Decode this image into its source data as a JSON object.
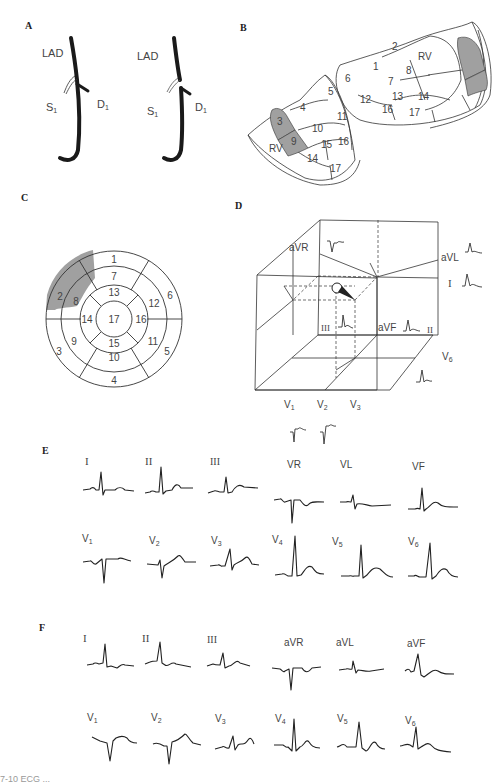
{
  "panels": {
    "A": {
      "label": "A",
      "left": {
        "lad": "LAD",
        "s1": "S",
        "s1_sub": "1",
        "d1": "D",
        "d1_sub": "1"
      },
      "right": {
        "lad": "LAD",
        "s1": "S",
        "s1_sub": "1",
        "d1": "D",
        "d1_sub": "1"
      }
    },
    "B": {
      "label": "B",
      "upper_segments": [
        "1",
        "2",
        "6",
        "7",
        "8",
        "12",
        "13",
        "14",
        "16",
        "17"
      ],
      "lower_segments": [
        "3",
        "4",
        "5",
        "9",
        "10",
        "11",
        "14",
        "15",
        "16",
        "17"
      ],
      "rv_label": "RV",
      "shaded": [
        "2",
        "8",
        "3",
        "9"
      ],
      "shade_color": "#a0a0a0"
    },
    "C": {
      "label": "C",
      "segments": [
        "1",
        "2",
        "3",
        "4",
        "5",
        "6",
        "7",
        "8",
        "9",
        "10",
        "11",
        "12",
        "13",
        "14",
        "15",
        "16",
        "17"
      ],
      "shaded": [
        "2",
        "8"
      ],
      "shade_color": "#a0a0a0"
    },
    "D": {
      "label": "D",
      "leads": {
        "avr": "aVR",
        "avl": "aVL",
        "i": "I",
        "iii": "III",
        "avf": "aVF",
        "ii": "II",
        "v6": "V",
        "v6_sub": "6",
        "v1": "V",
        "v1_sub": "1",
        "v2": "V",
        "v2_sub": "2",
        "v3": "V",
        "v3_sub": "3"
      }
    },
    "E": {
      "label": "E",
      "row1": [
        "I",
        "II",
        "III",
        "VR",
        "VL",
        "VF"
      ],
      "row2": [
        {
          "t": "V",
          "s": "1"
        },
        {
          "t": "V",
          "s": "2"
        },
        {
          "t": "V",
          "s": "3"
        },
        {
          "t": "V",
          "s": "4"
        },
        {
          "t": "V",
          "s": "5"
        },
        {
          "t": "V",
          "s": "6"
        }
      ]
    },
    "F": {
      "label": "F",
      "row1": [
        "I",
        "II",
        "III",
        "aVR",
        "aVL",
        "aVF"
      ],
      "row2": [
        {
          "t": "V",
          "s": "1"
        },
        {
          "t": "V",
          "s": "2"
        },
        {
          "t": "V",
          "s": "3"
        },
        {
          "t": "V",
          "s": "4"
        },
        {
          "t": "V",
          "s": "5"
        },
        {
          "t": "V",
          "s": "6"
        }
      ]
    }
  },
  "caption": "7-10  ECG ..."
}
